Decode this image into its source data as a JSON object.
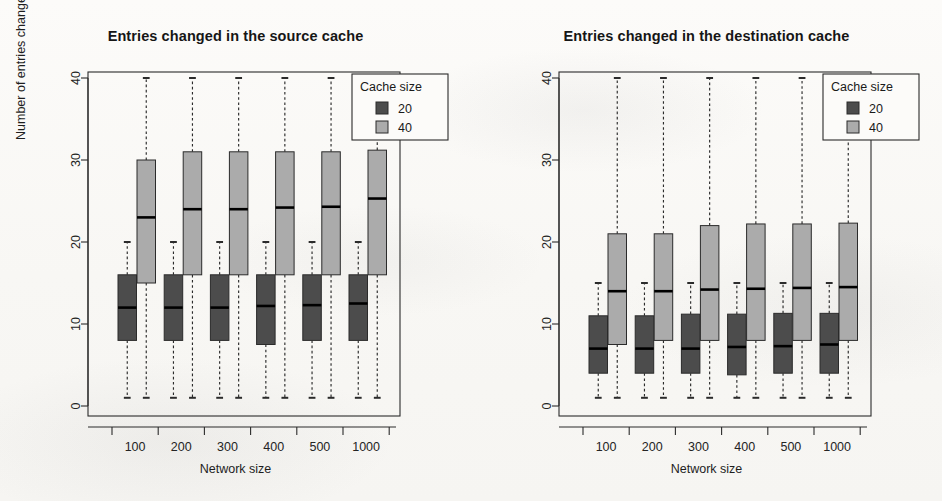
{
  "figure": {
    "panels": [
      {
        "id": "source",
        "title": "Entries changed in the source cache",
        "xlabel": "Network size",
        "ylabel": "Number of entries changed",
        "legend": {
          "title": "Cache size",
          "items": [
            {
              "label": "20",
              "color": "#4c4c4c"
            },
            {
              "label": "40",
              "color": "#ababab"
            }
          ]
        }
      },
      {
        "id": "destination",
        "title": "Entries changed in the destination cache",
        "xlabel": "Network size",
        "ylabel": "Number of entries changed",
        "legend": {
          "title": "Cache size",
          "items": [
            {
              "label": "20",
              "color": "#4c4c4c"
            },
            {
              "label": "40",
              "color": "#ababab"
            }
          ]
        }
      }
    ]
  },
  "chart_data": [
    {
      "type": "box",
      "title": "Entries changed in the source cache",
      "xlabel": "Network size",
      "ylabel": "Number of entries changed",
      "categories": [
        "100",
        "200",
        "300",
        "400",
        "500",
        "1000"
      ],
      "yticks": [
        0,
        10,
        20,
        30,
        40
      ],
      "ylim": [
        0,
        41
      ],
      "grid": false,
      "legend": {
        "title": "Cache size",
        "position": "top-right",
        "entries": [
          "20",
          "40"
        ]
      },
      "series": [
        {
          "name": "20",
          "color": "#4c4c4c",
          "boxes": [
            {
              "category": "100",
              "lower_whisker": 1,
              "q1": 8,
              "median": 12,
              "q3": 16,
              "upper_whisker": 20
            },
            {
              "category": "200",
              "lower_whisker": 1,
              "q1": 8,
              "median": 12,
              "q3": 16,
              "upper_whisker": 20
            },
            {
              "category": "300",
              "lower_whisker": 1,
              "q1": 8,
              "median": 12,
              "q3": 16,
              "upper_whisker": 20
            },
            {
              "category": "400",
              "lower_whisker": 1,
              "q1": 7.5,
              "median": 12.2,
              "q3": 16,
              "upper_whisker": 20
            },
            {
              "category": "500",
              "lower_whisker": 1,
              "q1": 8,
              "median": 12.3,
              "q3": 16,
              "upper_whisker": 20
            },
            {
              "category": "1000",
              "lower_whisker": 1,
              "q1": 8,
              "median": 12.5,
              "q3": 16,
              "upper_whisker": 20
            }
          ]
        },
        {
          "name": "40",
          "color": "#ababab",
          "boxes": [
            {
              "category": "100",
              "lower_whisker": 1,
              "q1": 15,
              "median": 23,
              "q3": 30,
              "upper_whisker": 40
            },
            {
              "category": "200",
              "lower_whisker": 1,
              "q1": 16,
              "median": 24,
              "q3": 31,
              "upper_whisker": 40
            },
            {
              "category": "300",
              "lower_whisker": 1,
              "q1": 16,
              "median": 24,
              "q3": 31,
              "upper_whisker": 40
            },
            {
              "category": "400",
              "lower_whisker": 1,
              "q1": 16,
              "median": 24.2,
              "q3": 31,
              "upper_whisker": 40
            },
            {
              "category": "500",
              "lower_whisker": 1,
              "q1": 16,
              "median": 24.3,
              "q3": 31,
              "upper_whisker": 40
            },
            {
              "category": "1000",
              "lower_whisker": 1,
              "q1": 16,
              "median": 25.3,
              "q3": 31.2,
              "upper_whisker": 40
            }
          ]
        }
      ]
    },
    {
      "type": "box",
      "title": "Entries changed in the destination cache",
      "xlabel": "Network size",
      "ylabel": "Number of entries changed",
      "categories": [
        "100",
        "200",
        "300",
        "400",
        "500",
        "1000"
      ],
      "yticks": [
        0,
        10,
        20,
        30,
        40
      ],
      "ylim": [
        0,
        41
      ],
      "grid": false,
      "legend": {
        "title": "Cache size",
        "position": "top-right",
        "entries": [
          "20",
          "40"
        ]
      },
      "series": [
        {
          "name": "20",
          "color": "#4c4c4c",
          "boxes": [
            {
              "category": "100",
              "lower_whisker": 1,
              "q1": 4,
              "median": 7,
              "q3": 11,
              "upper_whisker": 15
            },
            {
              "category": "200",
              "lower_whisker": 1,
              "q1": 4,
              "median": 7,
              "q3": 11,
              "upper_whisker": 15
            },
            {
              "category": "300",
              "lower_whisker": 1,
              "q1": 4,
              "median": 7,
              "q3": 11.2,
              "upper_whisker": 15
            },
            {
              "category": "400",
              "lower_whisker": 1,
              "q1": 3.8,
              "median": 7.2,
              "q3": 11.2,
              "upper_whisker": 15
            },
            {
              "category": "500",
              "lower_whisker": 1,
              "q1": 4,
              "median": 7.3,
              "q3": 11.3,
              "upper_whisker": 15
            },
            {
              "category": "1000",
              "lower_whisker": 1,
              "q1": 4,
              "median": 7.5,
              "q3": 11.3,
              "upper_whisker": 15
            }
          ]
        },
        {
          "name": "40",
          "color": "#ababab",
          "boxes": [
            {
              "category": "100",
              "lower_whisker": 1,
              "q1": 7.5,
              "median": 14,
              "q3": 21,
              "upper_whisker": 40
            },
            {
              "category": "200",
              "lower_whisker": 1,
              "q1": 8,
              "median": 14,
              "q3": 21,
              "upper_whisker": 40
            },
            {
              "category": "300",
              "lower_whisker": 1,
              "q1": 8,
              "median": 14.2,
              "q3": 22,
              "upper_whisker": 40
            },
            {
              "category": "400",
              "lower_whisker": 1,
              "q1": 8,
              "median": 14.3,
              "q3": 22.2,
              "upper_whisker": 40
            },
            {
              "category": "500",
              "lower_whisker": 1,
              "q1": 8,
              "median": 14.4,
              "q3": 22.2,
              "upper_whisker": 40
            },
            {
              "category": "1000",
              "lower_whisker": 1,
              "q1": 8,
              "median": 14.5,
              "q3": 22.3,
              "upper_whisker": 40
            }
          ]
        }
      ]
    }
  ]
}
